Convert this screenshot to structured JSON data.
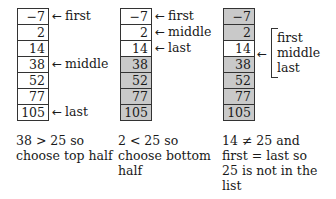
{
  "search_target": 25,
  "colors": {
    "shaded": "#c9c9c9",
    "plain": "#ffffff",
    "border": "#333333"
  },
  "panels": [
    {
      "values": [
        "−7",
        "2",
        "14",
        "38",
        "52",
        "77",
        "105"
      ],
      "shaded": [
        false,
        false,
        false,
        false,
        false,
        false,
        false
      ],
      "pointers": [
        {
          "row": 0,
          "label": "first"
        },
        {
          "row": 3,
          "label": "middle"
        },
        {
          "row": 6,
          "label": "last"
        }
      ],
      "caption": [
        "38 > 25 so",
        "choose top half"
      ]
    },
    {
      "values": [
        "−7",
        "2",
        "14",
        "38",
        "52",
        "77",
        "105"
      ],
      "shaded": [
        false,
        false,
        false,
        true,
        true,
        true,
        true
      ],
      "pointers": [
        {
          "row": 0,
          "label": "first"
        },
        {
          "row": 1,
          "label": "middle"
        },
        {
          "row": 2,
          "label": "last"
        }
      ],
      "caption": [
        "2 < 25 so",
        "choose bottom",
        "half"
      ]
    },
    {
      "values": [
        "−7",
        "2",
        "14",
        "38",
        "52",
        "77",
        "105"
      ],
      "shaded": [
        true,
        true,
        false,
        true,
        true,
        true,
        true
      ],
      "bracket_labels": [
        "first",
        "middle",
        "last"
      ],
      "bracket_row": 2,
      "caption": [
        "14 ≠ 25 and",
        "first = last so",
        "25 is not in the",
        "list"
      ]
    }
  ],
  "icons": {
    "arrow": "←"
  }
}
